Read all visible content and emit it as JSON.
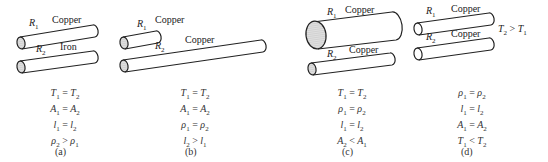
{
  "panels": [
    {
      "id": "a",
      "caption": "(a)",
      "wires": [
        {
          "resistor": "R",
          "index": "1",
          "material": "Copper"
        },
        {
          "resistor": "R",
          "index": "2",
          "material": "Iron"
        }
      ],
      "conditions": [
        {
          "l": "T",
          "li": "1",
          "op": "=",
          "r": "T",
          "ri": "2"
        },
        {
          "l": "A",
          "li": "1",
          "op": "=",
          "r": "A",
          "ri": "2"
        },
        {
          "l": "l",
          "li": "1",
          "op": "=",
          "r": "l",
          "ri": "2"
        },
        {
          "l": "ρ",
          "li": "2",
          "op": ">",
          "r": "ρ",
          "ri": "1"
        }
      ]
    },
    {
      "id": "b",
      "caption": "(b)",
      "wires": [
        {
          "resistor": "R",
          "index": "1",
          "material": "Copper"
        },
        {
          "resistor": "R",
          "index": "2",
          "material": "Copper"
        }
      ],
      "conditions": [
        {
          "l": "T",
          "li": "1",
          "op": "=",
          "r": "T",
          "ri": "2"
        },
        {
          "l": "A",
          "li": "1",
          "op": "=",
          "r": "A",
          "ri": "2"
        },
        {
          "l": "ρ",
          "li": "1",
          "op": "=",
          "r": "ρ",
          "ri": "2"
        },
        {
          "l": "l",
          "li": "2",
          "op": ">",
          "r": "l",
          "ri": "1"
        }
      ]
    },
    {
      "id": "c",
      "caption": "(c)",
      "wires": [
        {
          "resistor": "R",
          "index": "1",
          "material": "Copper"
        },
        {
          "resistor": "R",
          "index": "2",
          "material": "Copper"
        }
      ],
      "conditions": [
        {
          "l": "T",
          "li": "1",
          "op": "=",
          "r": "T",
          "ri": "2"
        },
        {
          "l": "ρ",
          "li": "1",
          "op": "=",
          "r": "ρ",
          "ri": "2"
        },
        {
          "l": "l",
          "li": "1",
          "op": "=",
          "r": "l",
          "ri": "2"
        },
        {
          "l": "A",
          "li": "2",
          "op": "<",
          "r": "A",
          "ri": "1"
        }
      ]
    },
    {
      "id": "d",
      "caption": "(d)",
      "annotation": {
        "l": "T",
        "li": "2",
        "op": ">",
        "r": "T",
        "ri": "1"
      },
      "wires": [
        {
          "resistor": "R",
          "index": "1",
          "material": "Copper"
        },
        {
          "resistor": "R",
          "index": "2",
          "material": "Copper"
        }
      ],
      "conditions": [
        {
          "l": "ρ",
          "li": "1",
          "op": "=",
          "r": "ρ",
          "ri": "2"
        },
        {
          "l": "l",
          "li": "1",
          "op": "=",
          "r": "l",
          "ri": "2"
        },
        {
          "l": "A",
          "li": "1",
          "op": "=",
          "r": "A",
          "ri": "2"
        },
        {
          "l": "T",
          "li": "1",
          "op": "<",
          "r": "T",
          "ri": "2"
        }
      ]
    }
  ]
}
